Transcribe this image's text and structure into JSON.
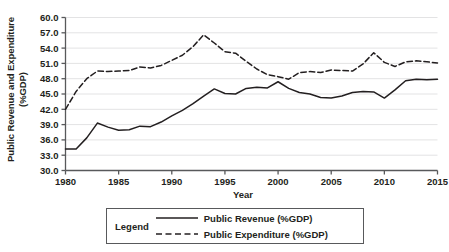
{
  "chart_data": {
    "type": "line",
    "title": "",
    "xlabel": "Year",
    "ylabel": "Public Revenue and Expenditure (%GDP)",
    "ylabel_line1": "Public Revenue and Expenditure",
    "ylabel_line2": "(%GDP)",
    "xlim": [
      1980,
      2015
    ],
    "ylim": [
      30.0,
      60.0
    ],
    "grid": true,
    "grid_axis": "y",
    "legend_position": "below-center",
    "legend_title": "Legend",
    "xticks": [
      1980,
      1985,
      1990,
      1995,
      2000,
      2005,
      2010,
      2015
    ],
    "xtick_labels": [
      "1980",
      "1985",
      "1990",
      "1995",
      "2000",
      "2005",
      "2010",
      "2015"
    ],
    "yticks": [
      30.0,
      33.0,
      36.0,
      39.0,
      42.0,
      45.0,
      48.0,
      51.0,
      54.0,
      57.0,
      60.0
    ],
    "ytick_labels": [
      "30.0",
      "33.0",
      "36.0",
      "39.0",
      "42.0",
      "45.0",
      "48.0",
      "51.0",
      "54.0",
      "57.0",
      "60.0"
    ],
    "x": [
      1980,
      1981,
      1982,
      1983,
      1984,
      1985,
      1986,
      1987,
      1988,
      1989,
      1990,
      1991,
      1992,
      1993,
      1994,
      1995,
      1996,
      1997,
      1998,
      1999,
      2000,
      2001,
      2002,
      2003,
      2004,
      2005,
      2006,
      2007,
      2008,
      2009,
      2010,
      2011,
      2012,
      2013,
      2014,
      2015
    ],
    "series": [
      {
        "name": "Public Revenue (%GDP)",
        "style": "solid",
        "color": "#231f20",
        "values": [
          34.2,
          34.2,
          36.4,
          39.3,
          38.5,
          37.9,
          38.0,
          38.7,
          38.6,
          39.5,
          40.7,
          41.8,
          43.1,
          44.6,
          46.0,
          45.1,
          45.0,
          46.1,
          46.3,
          46.2,
          47.4,
          46.1,
          45.3,
          45.0,
          44.3,
          44.2,
          44.6,
          45.3,
          45.5,
          45.4,
          44.2,
          45.8,
          47.6,
          47.9,
          47.8,
          47.9
        ]
      },
      {
        "name": "Public Expenditure (%GDP)",
        "style": "dashed",
        "color": "#231f20",
        "values": [
          42.0,
          45.5,
          48.0,
          49.5,
          49.4,
          49.5,
          49.6,
          50.3,
          50.1,
          50.6,
          51.6,
          52.6,
          54.3,
          56.6,
          55.0,
          53.3,
          53.0,
          51.4,
          49.9,
          48.8,
          48.4,
          47.9,
          49.2,
          49.4,
          49.2,
          49.7,
          49.6,
          49.5,
          50.9,
          53.1,
          51.2,
          50.4,
          51.3,
          51.5,
          51.3,
          51.1
        ]
      }
    ]
  }
}
